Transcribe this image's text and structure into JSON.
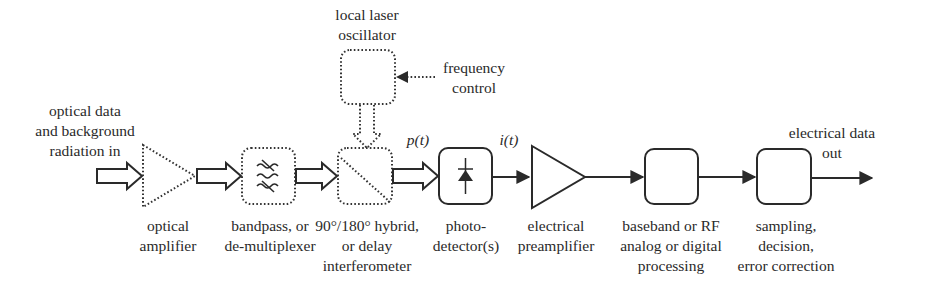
{
  "diagram": {
    "type": "block-diagram",
    "input": {
      "label_lines": [
        "optical data",
        "and background",
        "radiation in"
      ]
    },
    "output": {
      "label_lines": [
        "electrical data",
        "out"
      ]
    },
    "signals": {
      "optical_power": "p(t)",
      "photocurrent": "i(t)"
    },
    "local_oscillator": {
      "label_lines": [
        "local laser",
        "oscillator"
      ],
      "control_label_lines": [
        "frequency",
        "control"
      ]
    },
    "blocks": [
      {
        "id": "optical-amplifier",
        "shape": "triangle",
        "style": "dotted",
        "label_lines": [
          "optical",
          "amplifier"
        ]
      },
      {
        "id": "bandpass-filter",
        "shape": "rounded-box",
        "style": "dotted",
        "icon": "filter-icon",
        "label_lines": [
          "bandpass, or",
          "de-multiplexer"
        ]
      },
      {
        "id": "hybrid",
        "shape": "rounded-box",
        "style": "dotted",
        "icon": "beam-splitter-icon",
        "label_lines": [
          "90°/180° hybrid,",
          "or delay",
          "interferometer"
        ]
      },
      {
        "id": "photodetector",
        "shape": "rounded-box",
        "style": "solid",
        "icon": "photodiode-icon",
        "label_lines": [
          "photo-",
          "detector(s)"
        ]
      },
      {
        "id": "electrical-preamplifier",
        "shape": "triangle",
        "style": "solid",
        "label_lines": [
          "electrical",
          "preamplifier"
        ]
      },
      {
        "id": "baseband-processing",
        "shape": "rounded-box",
        "style": "solid",
        "label_lines": [
          "baseband or RF",
          "analog or digital",
          "processing"
        ]
      },
      {
        "id": "sampling-decision",
        "shape": "rounded-box",
        "style": "solid",
        "label_lines": [
          "sampling,",
          "decision,",
          "error correction"
        ]
      }
    ],
    "colors": {
      "line": "#2a2a2a",
      "background": "#ffffff"
    }
  }
}
